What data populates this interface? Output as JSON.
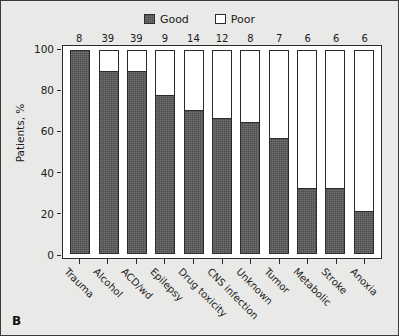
{
  "panel": {
    "letter": "B"
  },
  "legend": {
    "position": "top-center",
    "items": [
      {
        "label": "Good",
        "swatch": "dark-filled-square-icon",
        "color": "#4d4d4d"
      },
      {
        "label": "Poor",
        "swatch": "white-filled-square-icon",
        "color": "#ffffff"
      }
    ]
  },
  "axes": {
    "ylabel": "Patients, %",
    "yticks": [
      "0",
      "20",
      "40",
      "60",
      "80",
      "100"
    ]
  },
  "chart_data": {
    "type": "bar",
    "subtype": "stacked-100-percent",
    "title": "",
    "subtitle": "",
    "xlabel": "",
    "ylabel": "Patients, %",
    "ylim": [
      0,
      100
    ],
    "yticks": [
      0,
      20,
      40,
      60,
      80,
      100
    ],
    "grid": false,
    "legend_position": "top-center",
    "categories": [
      "Trauma",
      "Alcohol",
      "ACD/wd",
      "Epilepsy",
      "Drug toxicity",
      "CNS infection",
      "Unknown",
      "Tumor",
      "Metabolic",
      "Stroke",
      "Anoxia"
    ],
    "bar_counts": [
      8,
      39,
      39,
      9,
      14,
      12,
      8,
      7,
      6,
      6,
      6
    ],
    "series": [
      {
        "name": "Good",
        "color": "#4d4d4d",
        "values": [
          100,
          90,
          90,
          78,
          71,
          67,
          65,
          57,
          32,
          32,
          21
        ]
      },
      {
        "name": "Poor",
        "color": "#ffffff",
        "values": [
          0,
          10,
          10,
          22,
          29,
          33,
          35,
          43,
          68,
          68,
          79
        ]
      }
    ],
    "annotations": [
      {
        "text": "8",
        "category": "Trauma",
        "position": "above-bar"
      },
      {
        "text": "39",
        "category": "Alcohol",
        "position": "above-bar"
      },
      {
        "text": "39",
        "category": "ACD/wd",
        "position": "above-bar"
      },
      {
        "text": "9",
        "category": "Epilepsy",
        "position": "above-bar"
      },
      {
        "text": "14",
        "category": "Drug toxicity",
        "position": "above-bar"
      },
      {
        "text": "12",
        "category": "CNS infection",
        "position": "above-bar"
      },
      {
        "text": "8",
        "category": "Unknown",
        "position": "above-bar"
      },
      {
        "text": "7",
        "category": "Tumor",
        "position": "above-bar"
      },
      {
        "text": "6",
        "category": "Metabolic",
        "position": "above-bar"
      },
      {
        "text": "6",
        "category": "Stroke",
        "position": "above-bar"
      },
      {
        "text": "6",
        "category": "Anoxia",
        "position": "above-bar"
      }
    ]
  },
  "colors": {
    "good": "#4d4d4d",
    "poor": "#ffffff",
    "axis": "#2b2b2b",
    "background": "#e9e9e7",
    "plot_background": "#ffffff",
    "text": "#1b1b1b"
  }
}
